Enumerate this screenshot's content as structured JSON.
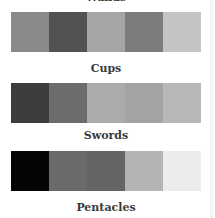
{
  "suits": [
    {
      "label": "Wands",
      "swatches": [
        "#8a8a8a",
        "#525252",
        "#a6a6a6",
        "#7c7c7c",
        "#c4c4c4"
      ]
    },
    {
      "label": "Cups",
      "swatches": [
        "#3c3c3c",
        "#6c6c6c",
        "#ababab",
        "#a3a3a3",
        "#b8b8b8"
      ]
    },
    {
      "label": "Swords",
      "swatches": [
        "#050505",
        "#6a6a6a",
        "#656565",
        "#b4b4b4",
        "#ececec"
      ]
    },
    {
      "label": "Pentacles",
      "swatches": []
    }
  ]
}
